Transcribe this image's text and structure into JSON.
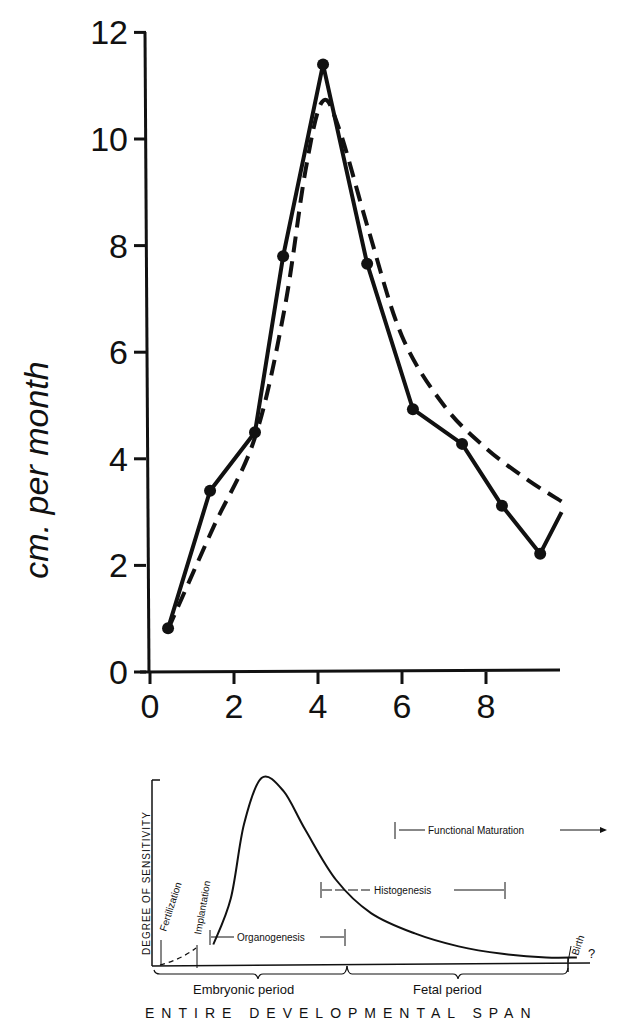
{
  "chart_data": [
    {
      "type": "line",
      "title": "",
      "xlabel": "",
      "ylabel": "cm. per month",
      "xlim": [
        0,
        9.8
      ],
      "ylim": [
        0,
        12
      ],
      "xticks": [
        0,
        2,
        4,
        6,
        8
      ],
      "yticks": [
        0,
        2,
        4,
        6,
        8,
        10,
        12
      ],
      "grid": false,
      "legend": null,
      "series": [
        {
          "name": "observed",
          "style": "solid-with-markers",
          "x": [
            0.43,
            1.43,
            2.5,
            3.17,
            4.12,
            5.17,
            6.26,
            7.43,
            8.38,
            9.29,
            9.8
          ],
          "y": [
            0.82,
            3.4,
            4.5,
            7.8,
            11.4,
            7.66,
            4.93,
            4.28,
            3.12,
            2.22,
            3.0
          ],
          "markers": [
            true,
            true,
            true,
            true,
            true,
            true,
            true,
            true,
            true,
            true,
            false
          ]
        },
        {
          "name": "smoothed",
          "style": "dashed",
          "x": [
            0.43,
            1.5,
            2.5,
            3.2,
            3.7,
            4.1,
            4.5,
            5.2,
            6.0,
            7.0,
            8.0,
            9.0,
            9.8
          ],
          "y": [
            0.8,
            2.7,
            4.4,
            6.8,
            9.4,
            10.7,
            10.2,
            8.3,
            6.3,
            5.0,
            4.2,
            3.6,
            3.2
          ]
        }
      ]
    },
    {
      "type": "line",
      "title": "",
      "ylabel": "DEGREE OF SENSITIVITY",
      "xlabel": "ENTIRE DEVELOPMENTAL SPAN",
      "description": "Schematic sensitivity curve across development",
      "series": [
        {
          "name": "sensitivity",
          "x": [
            0.02,
            0.1,
            0.14,
            0.18,
            0.21,
            0.25,
            0.3,
            0.35,
            0.42,
            0.5,
            0.6,
            0.7,
            0.8,
            0.9,
            0.97
          ],
          "y": [
            0.0,
            0.05,
            0.1,
            0.35,
            0.75,
            1.0,
            0.93,
            0.72,
            0.45,
            0.27,
            0.16,
            0.09,
            0.05,
            0.03,
            0.03
          ]
        }
      ],
      "annotations": {
        "fertilization": "Fertilization",
        "implantation": "Implantation",
        "organogenesis": "Organogenesis",
        "histogenesis": "Histogenesis",
        "functional_maturation": "Functional Maturation",
        "birth": "Birth",
        "question": "?",
        "embryonic_period": "Embryonic period",
        "fetal_period": "Fetal period"
      }
    }
  ]
}
